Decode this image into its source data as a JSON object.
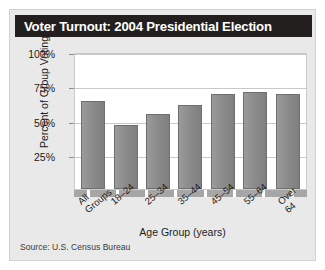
{
  "panel": {
    "title": "Voter Turnout: 2004 Presidential Election",
    "source": "Source: U.S. Census Bureau"
  },
  "chart_data": {
    "type": "bar",
    "title": "Voter Turnout: 2004 Presidential Election",
    "xlabel": "Age Group (years)",
    "ylabel": "Percent of Group Voting",
    "categories": [
      "All Groups",
      "18–24",
      "25–34",
      "35–44",
      "45–54",
      "55–64",
      "Over 64"
    ],
    "category_lines": [
      [
        "All",
        "Groups"
      ],
      [
        "18–24"
      ],
      [
        "25–34"
      ],
      [
        "35–44"
      ],
      [
        "45–54"
      ],
      [
        "55–64"
      ],
      [
        "Over",
        "64"
      ]
    ],
    "values": [
      64,
      47,
      55,
      61,
      69,
      71,
      69
    ],
    "ylim": [
      0,
      100
    ],
    "yticks": [
      100,
      75,
      50,
      25
    ],
    "ytick_labels": [
      "100%",
      "75%",
      "50%",
      "25%"
    ],
    "grid": true,
    "legend": false,
    "bar_color": "#8c8c8c",
    "title_bar_color": "#231f1f",
    "panel_color": "#e9e9e9"
  }
}
